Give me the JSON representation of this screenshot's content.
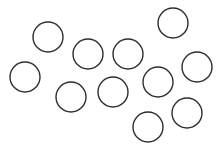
{
  "canvas": {
    "width": 222,
    "height": 149,
    "background": "#ffffff"
  },
  "style": {
    "stroke": "#2e2e2e",
    "stroke_width": 1.4,
    "fill": "none"
  },
  "circle_count": 11,
  "circles": [
    {
      "cx": 48,
      "cy": 37,
      "r": 15
    },
    {
      "cx": 173,
      "cy": 23,
      "r": 15
    },
    {
      "cx": 88,
      "cy": 54,
      "r": 15
    },
    {
      "cx": 128,
      "cy": 54,
      "r": 15
    },
    {
      "cx": 25,
      "cy": 77,
      "r": 15
    },
    {
      "cx": 197,
      "cy": 67,
      "r": 15
    },
    {
      "cx": 158,
      "cy": 82,
      "r": 15
    },
    {
      "cx": 71,
      "cy": 97,
      "r": 15
    },
    {
      "cx": 113,
      "cy": 92,
      "r": 15
    },
    {
      "cx": 187,
      "cy": 113,
      "r": 15
    },
    {
      "cx": 148,
      "cy": 127,
      "r": 15
    }
  ]
}
